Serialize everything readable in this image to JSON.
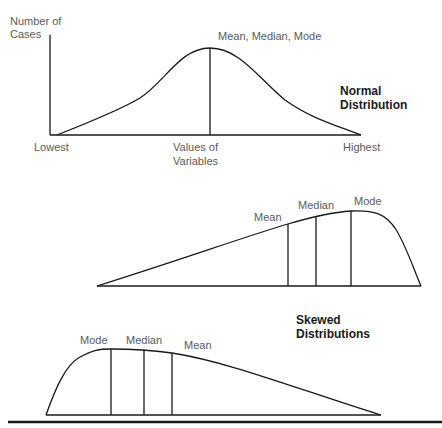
{
  "normal": {
    "y_axis_label_1": "Number of",
    "y_axis_label_2": "Cases",
    "peak_label": "Mean, Median, Mode",
    "title_1": "Normal",
    "title_2": "Distribution",
    "x_low": "Lowest",
    "x_mid_1": "Values of",
    "x_mid_2": "Variables",
    "x_high": "Highest"
  },
  "negative_skew": {
    "mean": "Mean",
    "median": "Median",
    "mode": "Mode"
  },
  "positive_skew": {
    "mode": "Mode",
    "median": "Median",
    "mean": "Mean",
    "title_1": "Skewed",
    "title_2": "Distributions"
  },
  "colors": {
    "line": "#1a1a1a",
    "label": "#5a5a5a"
  }
}
